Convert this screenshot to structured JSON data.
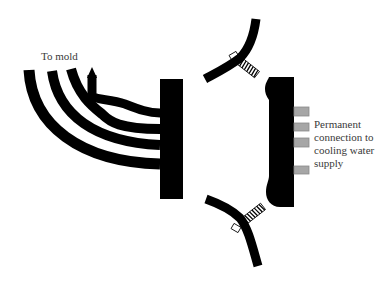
{
  "diagram": {
    "type": "mold cooling manifold quick-connect schematic",
    "labels": {
      "to_mold": "To mold",
      "cooling_1": "Permanent",
      "cooling_2": "connection to",
      "cooling_3": "cooling water",
      "cooling_4": "supply"
    },
    "components": [
      {
        "id": "hoses",
        "description": "Four curved hoses leading to mold",
        "count": 4
      },
      {
        "id": "left-manifold-block",
        "description": "Manifold plate connected to mold hoses"
      },
      {
        "id": "right-manifold-block",
        "description": "Manifold plate with permanent cooling water connections"
      },
      {
        "id": "upper-clamp",
        "description": "Spring-loaded clamp lever (top)"
      },
      {
        "id": "lower-clamp",
        "description": "Spring-loaded clamp lever (bottom)"
      },
      {
        "id": "water-connectors",
        "description": "Gray connector fittings",
        "count": 4
      }
    ],
    "colors": {
      "ink": "#000000",
      "connector_fill": "#a6a6a6",
      "connector_stroke": "#8a8a8a",
      "text": "#3a3a3a",
      "background": "#ffffff"
    }
  }
}
